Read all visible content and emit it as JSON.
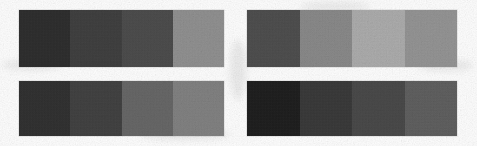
{
  "scene": {
    "title": "Grayscale step wedge patches",
    "description": "Four rectangular grayscale step-wedge patches arranged in a two-by-two grid on a white scanned background. Each patch is divided into four equal vertical bands of different gray levels.",
    "background_color": "#fdfdfd",
    "width": 477,
    "height": 146,
    "grain": "film-grain-texture",
    "patch_count": 4,
    "bands_per_patch": 4
  },
  "patches": [
    {
      "id": "patch-top-left",
      "label": "Top-left step wedge",
      "position": "top-left",
      "x": 19,
      "y": 10,
      "width": 205,
      "height": 57,
      "bands": [
        {
          "label": "band-1",
          "color": "#2b2b2b"
        },
        {
          "label": "band-2",
          "color": "#3d3d3d"
        },
        {
          "label": "band-3",
          "color": "#4a4a4a"
        },
        {
          "label": "band-4",
          "color": "#919191"
        }
      ]
    },
    {
      "id": "patch-top-right",
      "label": "Top-right step wedge",
      "position": "top-right",
      "x": 247,
      "y": 10,
      "width": 210,
      "height": 57,
      "bands": [
        {
          "label": "band-1",
          "color": "#4c4c4c"
        },
        {
          "label": "band-2",
          "color": "#8a8a8a"
        },
        {
          "label": "band-3",
          "color": "#aeaeae"
        },
        {
          "label": "band-4",
          "color": "#959595"
        }
      ]
    },
    {
      "id": "patch-bottom-left",
      "label": "Bottom-left step wedge",
      "position": "bottom-left",
      "x": 19,
      "y": 81,
      "width": 205,
      "height": 55,
      "bands": [
        {
          "label": "band-1",
          "color": "#2e2e2e"
        },
        {
          "label": "band-2",
          "color": "#3f3f3f"
        },
        {
          "label": "band-3",
          "color": "#666666"
        },
        {
          "label": "band-4",
          "color": "#828282"
        }
      ]
    },
    {
      "id": "patch-bottom-right",
      "label": "Bottom-right step wedge",
      "position": "bottom-right",
      "x": 247,
      "y": 81,
      "width": 210,
      "height": 55,
      "bands": [
        {
          "label": "band-1",
          "color": "#1b1b1b"
        },
        {
          "label": "band-2",
          "color": "#373737"
        },
        {
          "label": "band-3",
          "color": "#474747"
        },
        {
          "label": "band-4",
          "color": "#5e5e5e"
        }
      ]
    }
  ],
  "smudges": [
    {
      "x": 2,
      "y": 60,
      "w": 60,
      "h": 10
    },
    {
      "x": 140,
      "y": 128,
      "w": 90,
      "h": 12
    },
    {
      "x": 300,
      "y": 2,
      "w": 70,
      "h": 9
    },
    {
      "x": 418,
      "y": 60,
      "w": 55,
      "h": 11
    },
    {
      "x": 230,
      "y": 40,
      "w": 16,
      "h": 60
    }
  ]
}
